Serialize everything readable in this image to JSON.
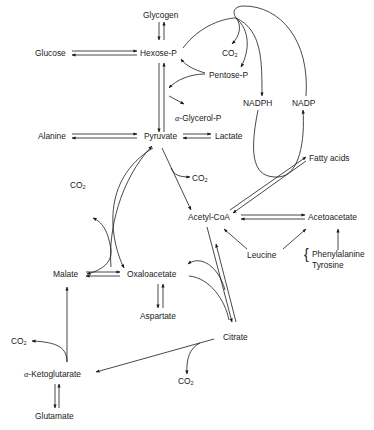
{
  "diagram": {
    "type": "metabolic-pathway",
    "nodes": {
      "glycogen": "Glycogen",
      "glucose": "Glucose",
      "hexose_p": "Hexose-P",
      "co2_top": "CO",
      "pentose_p": "Pentose-P",
      "nadph": "NADPH",
      "nadp": "NADP",
      "alpha_glycerol_p_prefix": "α-",
      "alpha_glycerol_p": "Glycerol-P",
      "alanine": "Alanine",
      "pyruvate": "Pyruvate",
      "lactate": "Lactate",
      "co2_left": "CO",
      "co2_pyr": "CO",
      "fatty_acids": "Fatty acids",
      "acetyl_coa": "Acetyl-CoA",
      "acetoacetate": "Acetoacetate",
      "leucine": "Leucine",
      "phenylalanine": "Phenylalanine",
      "tyrosine": "Tyrosine",
      "malate": "Malate",
      "oxaloacetate": "Oxaloacetate",
      "aspartate": "Aspartate",
      "citrate": "Citrate",
      "co2_akg": "CO",
      "alpha_ketoglutarate_prefix": "α-",
      "alpha_ketoglutarate": "Ketoglutarate",
      "co2_citrate": "CO",
      "glutamate": "Glutamate",
      "subscript_2": "2"
    },
    "edges": [
      {
        "from": "Glycogen",
        "to": "Hexose-P",
        "kind": "reversible"
      },
      {
        "from": "Glucose",
        "to": "Hexose-P",
        "kind": "reversible"
      },
      {
        "from": "Hexose-P",
        "to": "Pyruvate",
        "kind": "reversible"
      },
      {
        "from": "Hexose-P",
        "to": "Pentose-P",
        "kind": "curved"
      },
      {
        "from": "Pentose-P",
        "to": "Hexose-P",
        "kind": "curved"
      },
      {
        "from": "Hexose-P",
        "to": "CO2",
        "kind": "curved"
      },
      {
        "from": "Hexose-P",
        "to": "NADPH",
        "kind": "curved"
      },
      {
        "from": "NADPH",
        "to": "NADP",
        "kind": "curved-via-fatty-acids"
      },
      {
        "from": "NADP",
        "to": "Hexose-P",
        "kind": "curved"
      },
      {
        "from": "α-Glycerol-P",
        "to": "Hexose-P",
        "kind": "reversible"
      },
      {
        "from": "Alanine",
        "to": "Pyruvate",
        "kind": "reversible"
      },
      {
        "from": "Pyruvate",
        "to": "Lactate",
        "kind": "reversible"
      },
      {
        "from": "Pyruvate",
        "to": "Acetyl-CoA",
        "kind": "forward",
        "releases": "CO2"
      },
      {
        "from": "Acetyl-CoA",
        "to": "Fatty acids",
        "kind": "reversible"
      },
      {
        "from": "Acetyl-CoA",
        "to": "Acetoacetate",
        "kind": "reversible"
      },
      {
        "from": "Leucine",
        "to": "Acetyl-CoA",
        "kind": "forward"
      },
      {
        "from": "Leucine",
        "to": "Acetoacetate",
        "kind": "forward"
      },
      {
        "from": "Phenylalanine/Tyrosine",
        "to": "Acetoacetate",
        "kind": "forward"
      },
      {
        "from": "Pyruvate",
        "to": "Oxaloacetate",
        "kind": "forward"
      },
      {
        "from": "Malate",
        "to": "Pyruvate",
        "kind": "forward",
        "releases": "CO2"
      },
      {
        "from": "Malate",
        "to": "Oxaloacetate",
        "kind": "reversible"
      },
      {
        "from": "Oxaloacetate",
        "to": "Aspartate",
        "kind": "reversible"
      },
      {
        "from": "Acetyl-CoA",
        "to": "Citrate",
        "kind": "reversible"
      },
      {
        "from": "Oxaloacetate",
        "to": "Citrate",
        "kind": "curved"
      },
      {
        "from": "Citrate",
        "to": "α-Ketoglutarate",
        "kind": "forward",
        "releases": "CO2"
      },
      {
        "from": "α-Ketoglutarate",
        "to": "Malate",
        "kind": "forward",
        "releases": "CO2"
      },
      {
        "from": "α-Ketoglutarate",
        "to": "Glutamate",
        "kind": "reversible"
      }
    ]
  }
}
